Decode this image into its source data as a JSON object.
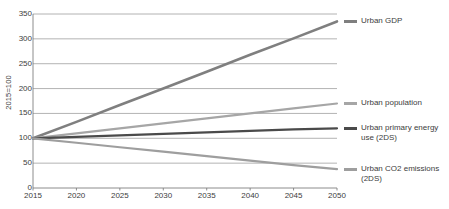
{
  "chart_data": {
    "type": "line",
    "title": "",
    "xlabel": "",
    "ylabel": "2015=100",
    "x": [
      2015,
      2020,
      2025,
      2030,
      2035,
      2040,
      2045,
      2050
    ],
    "xticklabels": [
      "2015",
      "2020",
      "2025",
      "2030",
      "2035",
      "2040",
      "2045",
      "2050"
    ],
    "yticklabels": [
      "0",
      "50",
      "100",
      "150",
      "200",
      "250",
      "300",
      "350"
    ],
    "yticks": [
      0,
      50,
      100,
      150,
      200,
      250,
      300,
      350
    ],
    "xlim": [
      2015,
      2050
    ],
    "ylim": [
      0,
      350
    ],
    "grid": "horizontal",
    "legend_position": "right",
    "series": [
      {
        "name": "Urban GDP",
        "color": "#7f7f7f",
        "width": 2.6,
        "values": [
          100,
          133,
          167,
          200,
          234,
          268,
          301,
          335
        ]
      },
      {
        "name": "Urban population",
        "color": "#a6a6a6",
        "width": 2.2,
        "values": [
          100,
          110,
          120,
          130,
          140,
          150,
          160,
          170
        ]
      },
      {
        "name": "Urban primary energy\nuse (2DS)",
        "color": "#4a4a4a",
        "width": 2.2,
        "values": [
          100,
          103,
          106,
          109,
          112,
          115,
          118,
          120
        ]
      },
      {
        "name": "Urban CO2 emissions\n(2DS)",
        "color": "#9e9e9e",
        "width": 2.2,
        "values": [
          100,
          91,
          82,
          73,
          64,
          55,
          46,
          38
        ]
      }
    ]
  },
  "axis": {
    "axis_color": "#808080",
    "grid_color": "#a0a0a0"
  },
  "legend": {
    "items": [
      {
        "label": "Urban GDP",
        "color": "#7f7f7f",
        "value": 335
      },
      {
        "label": "Urban population",
        "color": "#a6a6a6",
        "value": 170
      },
      {
        "label": "Urban primary energy\nuse (2DS)",
        "color": "#4a4a4a",
        "value": 120
      },
      {
        "label": "Urban CO2 emissions\n(2DS)",
        "color": "#9e9e9e",
        "value": 38
      }
    ]
  }
}
